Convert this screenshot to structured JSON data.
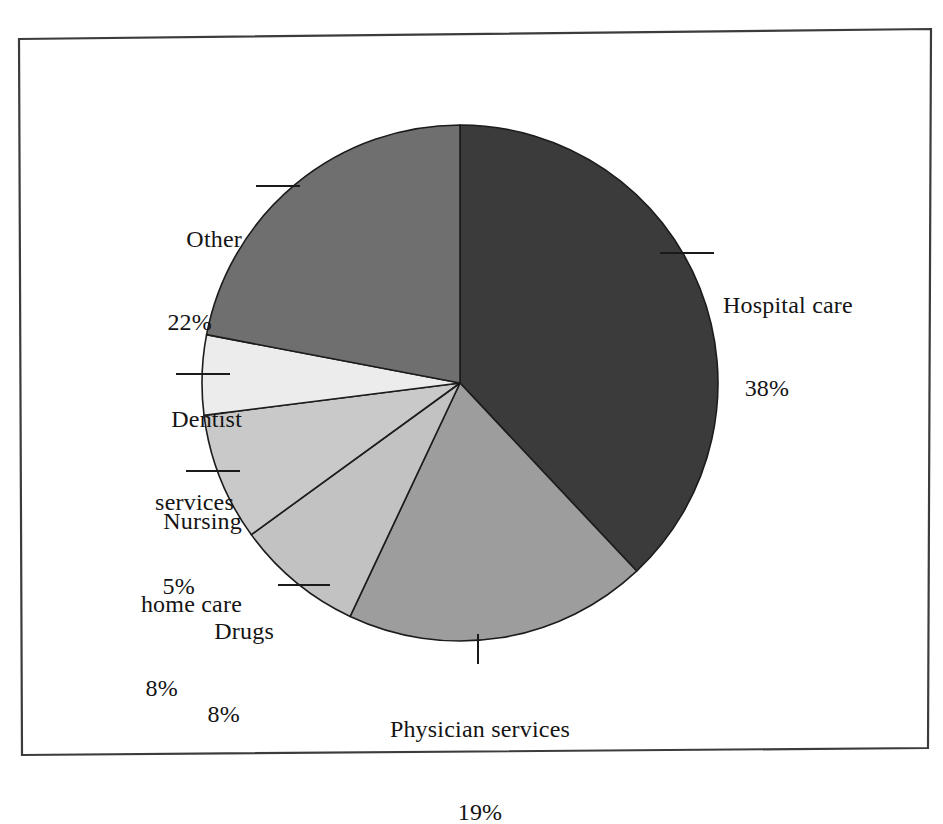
{
  "figure": {
    "name": "national-health-expenditure-pie-chart",
    "background_color": "#ffffff",
    "frame_color": "#3c3c3c"
  },
  "chart_data": {
    "type": "pie",
    "title": "",
    "subtitle": "",
    "xlabel": "",
    "ylabel": "",
    "legend_position": "none",
    "grid": false,
    "start_angle_deg": 0,
    "direction": "clockwise",
    "units": "percent",
    "total": 100,
    "categories": [
      "Hospital care",
      "Physician services",
      "Drugs",
      "Nursing home care",
      "Dentist services",
      "Other"
    ],
    "values": [
      38,
      19,
      8,
      8,
      5,
      22
    ],
    "slice_colors": [
      "#3b3b3b",
      "#9d9d9d",
      "#c2c2c2",
      "#c9c9c9",
      "#ececec",
      "#6f6f6f"
    ],
    "slices": [
      {
        "label": "Hospital care",
        "value": 38,
        "value_text": "38%",
        "color": "#3b3b3b",
        "start_angle_deg": 0,
        "end_angle_deg": 136.8
      },
      {
        "label": "Physician services",
        "value": 19,
        "value_text": "19%",
        "color": "#9d9d9d",
        "start_angle_deg": 136.8,
        "end_angle_deg": 205.2
      },
      {
        "label": "Drugs",
        "value": 8,
        "value_text": "8%",
        "color": "#c2c2c2",
        "start_angle_deg": 205.2,
        "end_angle_deg": 234.0
      },
      {
        "label": "Nursing home care",
        "value": 8,
        "value_text": "8%",
        "color": "#c9c9c9",
        "start_angle_deg": 234.0,
        "end_angle_deg": 262.8
      },
      {
        "label": "Dentist services",
        "value": 5,
        "value_text": "5%",
        "color": "#ececec",
        "start_angle_deg": 262.8,
        "end_angle_deg": 280.8
      },
      {
        "label": "Other",
        "value": 22,
        "value_text": "22%",
        "color": "#6f6f6f",
        "start_angle_deg": 280.8,
        "end_angle_deg": 360.0
      }
    ]
  },
  "labels": {
    "hospital": {
      "name": "Hospital care",
      "percent": "38%"
    },
    "other": {
      "name": "Other",
      "percent": "22%"
    },
    "dentist": {
      "line1": "Dentist",
      "line2": "services",
      "percent": "5%"
    },
    "nursing": {
      "line1": "Nursing",
      "line2": "home care",
      "percent": "8%"
    },
    "drugs": {
      "name": "Drugs",
      "percent": "8%"
    },
    "physician": {
      "name": "Physician services",
      "percent": "19%"
    }
  }
}
